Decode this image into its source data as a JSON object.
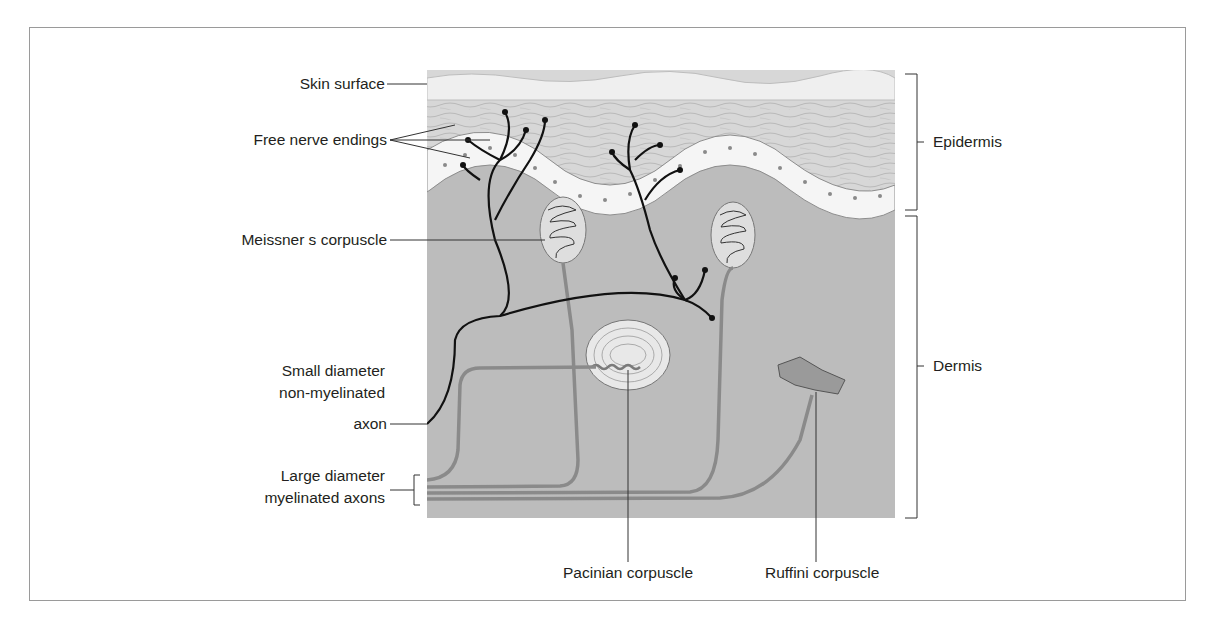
{
  "figure": {
    "labels": {
      "skin_surface": "Skin surface",
      "free_nerve_endings": "Free nerve endings",
      "meissner": "Meissner s corpuscle",
      "small_axon_line1": "Small diameter",
      "small_axon_line2": "non-myelinated",
      "small_axon_line3": "axon",
      "large_axon_line1": "Large diameter",
      "large_axon_line2": "myelinated axons",
      "pacinian": "Pacinian corpuscle",
      "ruffini": "Ruffini corpuscle",
      "epidermis": "Epidermis",
      "dermis": "Dermis"
    },
    "colors": {
      "dermis": "#b9b9b9",
      "epidermis": "#d6d6d6",
      "stratum_corneum": "#ececec",
      "basal_cells": "#f4f4f4",
      "nerve_black": "#111111",
      "myelinated_axon": "#8a8a8a",
      "frame": "#9a9a9a"
    }
  }
}
